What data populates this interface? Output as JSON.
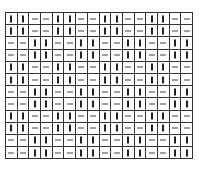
{
  "diagram": {
    "type": "pattern-grid",
    "columns": 16,
    "rows": 12,
    "symbols": {
      "V": "vertical-bar",
      "H": "horizontal-dash"
    },
    "block_size": 2,
    "pattern_rows": [
      "VVHHVVHHVVHHVVHH",
      "VVHHVVHHVVHHVVHH",
      "HHVVHHVVHHVVHHVV",
      "HHVVHHVVHHVVHHVV",
      "VVHHVVHHVVHHVVHH",
      "VVHHVVHHVVHHVVHH",
      "HHVVHHVVHHVVHHVV",
      "HHVVHHVVHHVVHHVV",
      "VVHHVVHHVVHHVVHH",
      "VVHHVVHHVVHHVVHH",
      "HHVVHHVVHHVVHHVV",
      "HHVVHHVVHHVVHHVV"
    ],
    "colors": {
      "line": "#333333",
      "mark": "#222222",
      "background": "#ffffff"
    },
    "caption": ""
  }
}
